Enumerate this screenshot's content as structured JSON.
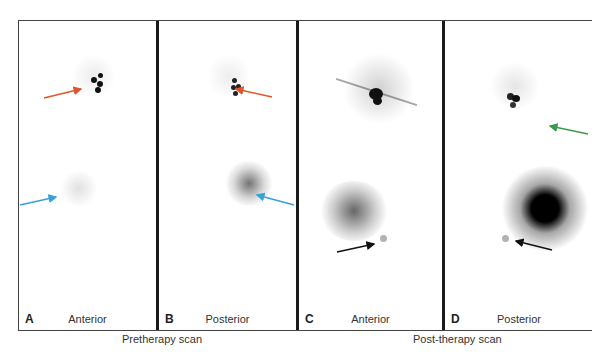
{
  "panels": [
    {
      "letter": "A",
      "view": "Anterior"
    },
    {
      "letter": "B",
      "view": "Posterior"
    },
    {
      "letter": "C",
      "view": "Anterior"
    },
    {
      "letter": "D",
      "view": "Posterior"
    }
  ],
  "captions": {
    "pretherapy": "Pretherapy scan",
    "posttherapy": "Post-therapy scan"
  },
  "colors": {
    "orange_arrow": "#e0552a",
    "blue_arrow": "#3aa0d8",
    "green_arrow": "#3a9a4a",
    "black_arrow": "#111111"
  }
}
